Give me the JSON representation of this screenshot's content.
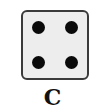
{
  "die": {
    "face_value": 4,
    "pips": [
      {
        "position": "top-left"
      },
      {
        "position": "top-right"
      },
      {
        "position": "bottom-left"
      },
      {
        "position": "bottom-right"
      }
    ],
    "fill_color": "#ededed",
    "border_color": "#3a3a3a",
    "pip_color": "#0a0a0a"
  },
  "label": "C"
}
